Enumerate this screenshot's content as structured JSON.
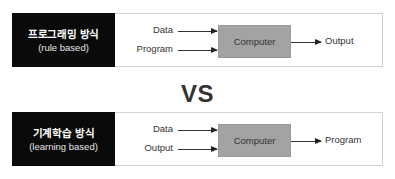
{
  "panels": [
    {
      "title": "프로그래밍 방식",
      "subtitle": "(rule based)",
      "inputs": [
        "Data",
        "Program"
      ],
      "processor": "Computer",
      "output": "Output"
    },
    {
      "title": "기계학습 방식",
      "subtitle": "(learning based)",
      "inputs": [
        "Data",
        "Output"
      ],
      "processor": "Computer",
      "output": "Program"
    }
  ],
  "separator": "VS",
  "colors": {
    "label_bg": "#0a0a0a",
    "computer_bg": "#a3a3a3",
    "border": "#d2d2d2"
  }
}
